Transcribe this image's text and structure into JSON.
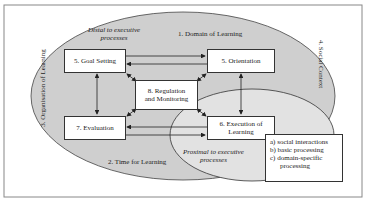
{
  "diagram": {
    "outer_regions": {
      "domain_label": "1. Domain of Learning",
      "time_label": "2. Time for Learning",
      "organisation_label": "3. Organisation of Learning",
      "social_label": "4. Social Context"
    },
    "zones": {
      "distal_line1": "Distal to executive",
      "distal_line2": "processes",
      "proximal_line1": "Proximal to executive",
      "proximal_line2": "processes"
    },
    "boxes": {
      "goal_setting": "5. Goal Setting",
      "orientation": "5. Orientation",
      "regulation_line1": "8. Regulation",
      "regulation_line2": "and Monitoring",
      "evaluation": "7. Evaluation",
      "execution_line1": "6. Execution of",
      "execution_line2": "Learning"
    },
    "legend": {
      "a": "a)  social interactions",
      "b": "b)  basic processing",
      "c_line1": "c)  domain-specific",
      "c_line2": "processing"
    },
    "colors": {
      "outer_ellipse_fill": "#cfcfcf",
      "inner_ellipse_fill": "#e2e2e2",
      "stroke": "#333333",
      "frame": "#888888"
    }
  }
}
